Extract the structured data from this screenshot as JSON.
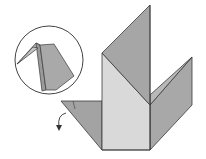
{
  "diagram": {
    "colors": {
      "background": "#ffffff",
      "paper_dark": "#a3a3a3",
      "paper_mid": "#b4b4b4",
      "paper_light": "#d9d9d9",
      "outline": "#3a3a3a"
    },
    "inset": {
      "shape": "circle",
      "content": "close-up of folded point"
    },
    "annotations": {
      "arrow": "curved fold arrow pointing down"
    }
  }
}
